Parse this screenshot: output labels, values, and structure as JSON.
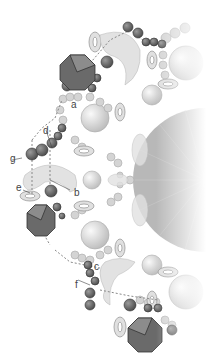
{
  "diagram": {
    "labels": [
      {
        "id": "a",
        "text": "a",
        "x": 71,
        "y": 100
      },
      {
        "id": "b",
        "text": "b",
        "x": 74,
        "y": 188
      },
      {
        "id": "c",
        "text": "c",
        "x": 94,
        "y": 262
      },
      {
        "id": "d",
        "text": "d",
        "x": 43,
        "y": 126
      },
      {
        "id": "e",
        "text": "e",
        "x": 16,
        "y": 183
      },
      {
        "id": "f",
        "text": "f",
        "x": 75,
        "y": 280
      },
      {
        "id": "g",
        "text": "g",
        "x": 10,
        "y": 154
      }
    ],
    "colors": {
      "dark_bead": "#6e6e6e",
      "light_bead": "#cfcfcf",
      "crescent": "#e3e3e3",
      "octagon_dark": "#5a5a5a",
      "octagon_light": "#8c8c8c",
      "thread": "#888888"
    }
  }
}
